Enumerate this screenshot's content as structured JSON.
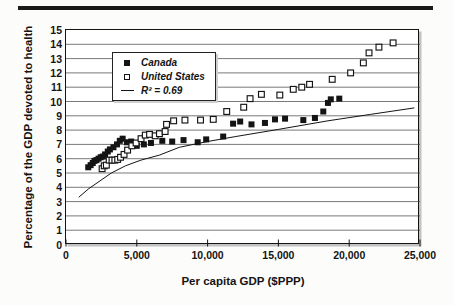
{
  "page": {
    "background": "#fcfcfb",
    "top_rule_color": "#1a1a1a"
  },
  "colors": {
    "marker": "#141414",
    "grid": "#3f3f3f",
    "box_border": "#141414",
    "shadow": "#c2c2c2",
    "text": "#141414",
    "fit_line": "#141414"
  },
  "chart_data": {
    "type": "scatter",
    "title": "",
    "xlabel": "Per capita GDP ($PPP)",
    "ylabel": "Percentage of the GDP devoted to health",
    "xlim": [
      0,
      25000
    ],
    "ylim": [
      0,
      15
    ],
    "grid": "horizontal-only",
    "legend_position": "upper-left-inside",
    "x_ticks": [
      {
        "v": 0,
        "label": "0"
      },
      {
        "v": 5000,
        "label": "5,000"
      },
      {
        "v": 10000,
        "label": "10,000"
      },
      {
        "v": 15000,
        "label": "15,000"
      },
      {
        "v": 20000,
        "label": "20,000"
      },
      {
        "v": 25000,
        "label": "25,000"
      }
    ],
    "y_ticks": [
      "0",
      "1",
      "2",
      "3",
      "4",
      "5",
      "6",
      "7",
      "8",
      "9",
      "10",
      "11",
      "12",
      "13",
      "14",
      "15"
    ],
    "legend": {
      "entries": [
        {
          "marker": "filled-square",
          "label": "Canada"
        },
        {
          "marker": "open-square",
          "label": "United States"
        },
        {
          "marker": "line",
          "label": "R² = 0.69"
        }
      ]
    },
    "series": [
      {
        "name": "Canada",
        "marker": "filled-square",
        "points": [
          [
            1570,
            5.4
          ],
          [
            1740,
            5.55
          ],
          [
            1890,
            5.7
          ],
          [
            2010,
            5.85
          ],
          [
            2150,
            5.9
          ],
          [
            2300,
            6.0
          ],
          [
            2450,
            6.1
          ],
          [
            2600,
            6.15
          ],
          [
            2760,
            6.3
          ],
          [
            2950,
            6.5
          ],
          [
            3100,
            6.65
          ],
          [
            3350,
            6.8
          ],
          [
            3600,
            7.0
          ],
          [
            3800,
            7.25
          ],
          [
            4000,
            7.4
          ],
          [
            4300,
            7.15
          ],
          [
            4600,
            7.2
          ],
          [
            5000,
            6.9
          ],
          [
            5500,
            7.0
          ],
          [
            6000,
            7.1
          ],
          [
            6800,
            7.25
          ],
          [
            7500,
            7.2
          ],
          [
            8300,
            7.3
          ],
          [
            9300,
            7.15
          ],
          [
            9900,
            7.35
          ],
          [
            11100,
            7.55
          ],
          [
            11800,
            8.45
          ],
          [
            12300,
            8.6
          ],
          [
            13100,
            8.4
          ],
          [
            14050,
            8.5
          ],
          [
            14760,
            8.75
          ],
          [
            15470,
            8.8
          ],
          [
            16760,
            8.7
          ],
          [
            17580,
            8.85
          ],
          [
            18170,
            9.3
          ],
          [
            18500,
            9.9
          ],
          [
            18700,
            10.15
          ],
          [
            19300,
            10.2
          ]
        ]
      },
      {
        "name": "United States",
        "marker": "open-square",
        "points": [
          [
            2550,
            5.3
          ],
          [
            2700,
            5.5
          ],
          [
            2850,
            5.55
          ],
          [
            3050,
            5.9
          ],
          [
            3250,
            5.9
          ],
          [
            3450,
            5.9
          ],
          [
            3650,
            5.95
          ],
          [
            3850,
            6.1
          ],
          [
            4100,
            6.3
          ],
          [
            4350,
            6.6
          ],
          [
            4650,
            6.9
          ],
          [
            4950,
            7.1
          ],
          [
            5300,
            7.4
          ],
          [
            5600,
            7.65
          ],
          [
            5900,
            7.7
          ],
          [
            6300,
            7.6
          ],
          [
            6600,
            7.75
          ],
          [
            7000,
            7.9
          ],
          [
            7100,
            8.4
          ],
          [
            7600,
            8.65
          ],
          [
            8400,
            8.7
          ],
          [
            9500,
            8.7
          ],
          [
            10400,
            8.75
          ],
          [
            11350,
            9.3
          ],
          [
            12550,
            9.6
          ],
          [
            13000,
            10.2
          ],
          [
            13800,
            10.5
          ],
          [
            15100,
            10.45
          ],
          [
            16050,
            10.85
          ],
          [
            16650,
            11.0
          ],
          [
            17200,
            11.2
          ],
          [
            18800,
            11.55
          ],
          [
            20100,
            12.0
          ],
          [
            21000,
            12.7
          ],
          [
            21400,
            13.4
          ],
          [
            22100,
            13.8
          ],
          [
            23100,
            14.1
          ]
        ]
      },
      {
        "name": "R² = 0.69",
        "type": "line",
        "points": [
          [
            900,
            3.3
          ],
          [
            1600,
            3.9
          ],
          [
            2400,
            4.45
          ],
          [
            3200,
            5.0
          ],
          [
            4200,
            5.5
          ],
          [
            5300,
            5.9
          ],
          [
            6600,
            6.25
          ],
          [
            8000,
            6.8
          ],
          [
            10000,
            7.2
          ],
          [
            12000,
            7.55
          ],
          [
            15000,
            8.05
          ],
          [
            18500,
            8.65
          ],
          [
            21500,
            9.1
          ],
          [
            24600,
            9.55
          ]
        ]
      }
    ]
  }
}
